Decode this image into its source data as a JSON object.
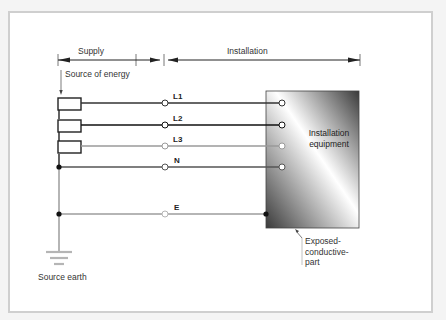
{
  "diagram": {
    "header": {
      "supply_label": "Supply",
      "installation_label": "Installation"
    },
    "source_of_energy_label": "Source of energy",
    "source_earth_label": "Source earth",
    "equipment": {
      "label_line1": "Installation",
      "label_line2": "equipment"
    },
    "exposed_conductive_part": {
      "line1": "Exposed-",
      "line2": "conductive-",
      "line3": "part"
    },
    "conductors": [
      {
        "id": "L1",
        "label": "L1",
        "color": "#333333"
      },
      {
        "id": "L2",
        "label": "L2",
        "color": "#111111"
      },
      {
        "id": "L3",
        "label": "L3",
        "color": "#9a9a9a"
      },
      {
        "id": "N",
        "label": "N",
        "color": "#555555"
      },
      {
        "id": "E",
        "label": "E",
        "color": "#b5b5b5"
      }
    ],
    "colors": {
      "frame_border": "#cfcfcf",
      "equipment_dark": "#3a3a3a",
      "equipment_light": "#ffffff"
    }
  }
}
